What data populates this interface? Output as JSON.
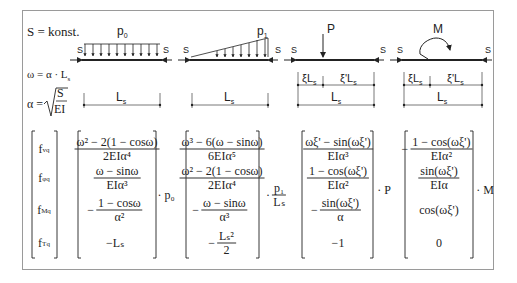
{
  "header": {
    "constant": "S = konst.",
    "omega_def": "ω = α · L",
    "omega_def_sub": "s",
    "alpha_label": "α =",
    "alpha_num": "S",
    "alpha_den": "EI"
  },
  "loads": [
    {
      "id": "p0",
      "label": "p",
      "label_sub": "0",
      "type": "uniform"
    },
    {
      "id": "p1",
      "label": "p",
      "label_sub": "1",
      "type": "triangular"
    },
    {
      "id": "P",
      "label": "P",
      "type": "point"
    },
    {
      "id": "M",
      "label": "M",
      "type": "moment"
    }
  ],
  "axial_label": "S",
  "dims": {
    "Ls": "L",
    "Ls_sub": "s",
    "xi": "ξL",
    "xi_prime": "ξ'L"
  },
  "vector": {
    "labels": [
      {
        "f": "f",
        "sub": "vq"
      },
      {
        "f": "f",
        "sub": "φq"
      },
      {
        "f": "f",
        "sub": "Mq"
      },
      {
        "f": "f",
        "sub": "Tq"
      }
    ]
  },
  "matrices": [
    {
      "multiplier": "· p₀",
      "entries": [
        {
          "sign": "",
          "num": "ω² − 2(1 − cosω)",
          "den": "2EIα⁴"
        },
        {
          "sign": "",
          "num": "ω − sinω",
          "den": "EIα³"
        },
        {
          "sign": "−",
          "num": "1 − cosω",
          "den": "α²"
        },
        {
          "sign": "",
          "plain": "−Lₛ"
        }
      ]
    },
    {
      "multiplier_prefix": "·",
      "multiplier_num": "p₁",
      "multiplier_den": "Lₛ",
      "entries": [
        {
          "sign": "",
          "num": "ω³ − 6(ω − sinω)",
          "den": "6EIα⁵"
        },
        {
          "sign": "",
          "num": "ω² − 2(1 − cosω)",
          "den": "2EIα⁴"
        },
        {
          "sign": "−",
          "num": "ω − sinω",
          "den": "α³"
        },
        {
          "sign": "−",
          "num": "Lₛ²",
          "den": "2"
        }
      ]
    },
    {
      "multiplier": "· P",
      "entries": [
        {
          "sign": "",
          "num": "ωξ' − sin(ωξ')",
          "den": "EIα³"
        },
        {
          "sign": "",
          "num": "1 − cos(ωξ')",
          "den": "EIα²"
        },
        {
          "sign": "−",
          "num": "sin(ωξ')",
          "den": "α"
        },
        {
          "sign": "",
          "plain": "−1"
        }
      ]
    },
    {
      "multiplier": "· M",
      "entries": [
        {
          "sign": "−",
          "num": "1 − cos(ωξ')",
          "den": "EIα²"
        },
        {
          "sign": "",
          "num": "sin(ωξ')",
          "den": "EIα"
        },
        {
          "sign": "",
          "plain": "cos(ωξ')"
        },
        {
          "sign": "",
          "plain": "0"
        }
      ]
    }
  ],
  "colors": {
    "stroke": "#222222",
    "frame": "#9a9a9a",
    "dim": "#555555"
  }
}
